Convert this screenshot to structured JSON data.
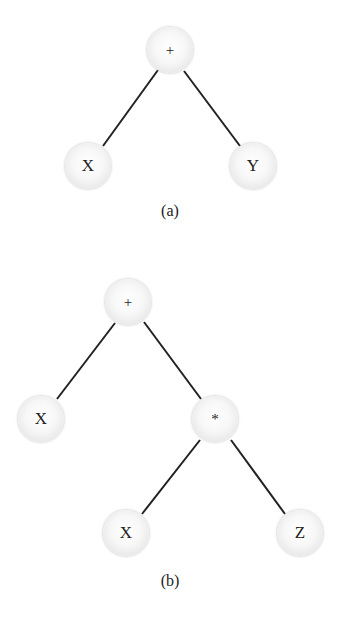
{
  "figures": [
    {
      "caption": "(a)",
      "caption_pos": [
        170,
        212
      ],
      "nodes": [
        {
          "id": "a_plus",
          "label": "+",
          "x": 170,
          "y": 50
        },
        {
          "id": "a_x",
          "label": "X",
          "x": 88,
          "y": 166
        },
        {
          "id": "a_y",
          "label": "Y",
          "x": 253,
          "y": 166
        }
      ],
      "edges": [
        [
          "a_plus",
          "a_x"
        ],
        [
          "a_plus",
          "a_y"
        ]
      ]
    },
    {
      "caption": "(b)",
      "caption_pos": [
        170,
        582
      ],
      "nodes": [
        {
          "id": "b_plus",
          "label": "+",
          "x": 128,
          "y": 302
        },
        {
          "id": "b_x",
          "label": "X",
          "x": 41,
          "y": 419
        },
        {
          "id": "b_mul",
          "label": "*",
          "x": 215,
          "y": 419
        },
        {
          "id": "b_x2",
          "label": "X",
          "x": 126,
          "y": 533
        },
        {
          "id": "b_z",
          "label": "Z",
          "x": 300,
          "y": 533
        }
      ],
      "edges": [
        [
          "b_plus",
          "b_x"
        ],
        [
          "b_plus",
          "b_mul"
        ],
        [
          "b_mul",
          "b_x2"
        ],
        [
          "b_mul",
          "b_z"
        ]
      ]
    }
  ],
  "colors": {
    "edge": "#222222",
    "text": "#222222",
    "background": "#ffffff"
  }
}
